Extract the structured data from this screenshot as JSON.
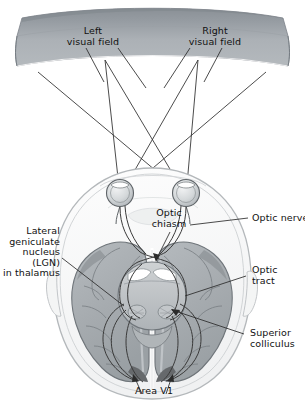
{
  "figure": {
    "labels": {
      "left_visual_field": "Left\nvisual field",
      "right_visual_field": "Right\nvisual field",
      "optic_chiasm": "Optic\nchiasm",
      "optic_nerve": "Optic nerve",
      "optic_tract": "Optic\ntract",
      "lgn": "Lateral\ngeniculate\nnucleus\n(LGN)\nin thalamus",
      "superior_colliculus": "Superior\ncolliculus",
      "area_v1": "Area V1"
    },
    "colors": {
      "band_top": "#8e949a",
      "band_body": "#a9aeb3",
      "band_edge": "#7e858b",
      "skull_outline": "#b9bcbf",
      "skull_fill": "#fbfbfb",
      "brain_fill": "#a9aeb2",
      "brain_dark": "#8d9397",
      "brain_light": "#c6cacd",
      "midbrain_fill": "#b6babd",
      "eye_fill": "#d8dbdd",
      "line": "#2b2b2b",
      "text": "#111111"
    }
  }
}
